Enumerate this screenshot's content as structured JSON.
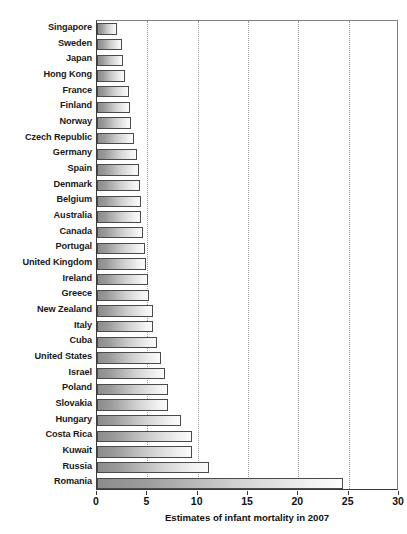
{
  "chart_data": {
    "type": "bar",
    "orientation": "horizontal",
    "title": "",
    "xlabel": "Estimates of infant mortality in 2007",
    "ylabel": "",
    "xlim": [
      0,
      30
    ],
    "xticks": [
      0,
      5,
      10,
      15,
      20,
      25,
      30
    ],
    "xtick_labels": [
      "0",
      "5",
      "10",
      "15",
      "20",
      "25",
      "30"
    ],
    "grid": "vertical-dotted",
    "legend": "none",
    "categories": [
      "Singapore",
      "Sweden",
      "Japan",
      "Hong Kong",
      "France",
      "Finland",
      "Norway",
      "Czech Republic",
      "Germany",
      "Spain",
      "Denmark",
      "Belgium",
      "Australia",
      "Canada",
      "Portugal",
      "United Kingdom",
      "Ireland",
      "Greece",
      "New Zealand",
      "Italy",
      "Cuba",
      "United States",
      "Israel",
      "Poland",
      "Slovakia",
      "Hungary",
      "Costa Rica",
      "Kuwait",
      "Russia",
      "Romania"
    ],
    "values": [
      2.0,
      2.5,
      2.6,
      2.8,
      3.2,
      3.3,
      3.4,
      3.7,
      4.0,
      4.2,
      4.3,
      4.4,
      4.4,
      4.6,
      4.8,
      4.9,
      5.1,
      5.2,
      5.6,
      5.6,
      6.0,
      6.4,
      6.8,
      7.1,
      7.1,
      8.3,
      9.4,
      9.4,
      11.1,
      24.4
    ],
    "bar_fill": "#b8b8b8",
    "bar_edge_color": "#4a4a4a",
    "gridline_color": "#9a9a9a",
    "axis_color": "#3a3a3a",
    "background": "#ffffff"
  }
}
